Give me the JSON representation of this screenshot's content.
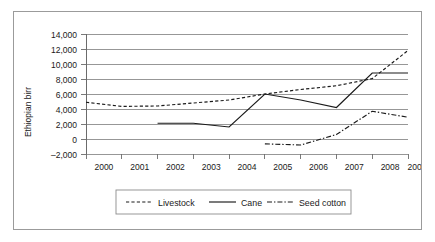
{
  "figure": {
    "name": "ethiopian-birr-commodity-line-chart",
    "border_color": "#9b9b9b",
    "background_color": "#ffffff"
  },
  "chart_data": {
    "type": "line",
    "title": "",
    "xlabel": "",
    "ylabel": "Ethiopian birr",
    "x": [
      2000,
      2001,
      2002,
      2003,
      2004,
      2005,
      2006,
      2007,
      2008,
      2009
    ],
    "categories": [
      "2000",
      "2001",
      "2002",
      "2003",
      "2004",
      "2005",
      "2006",
      "2007",
      "2008",
      "2009"
    ],
    "ylim": [
      -2000,
      14000
    ],
    "ytick_values": [
      -2000,
      0,
      2000,
      4000,
      6000,
      8000,
      10000,
      12000,
      14000
    ],
    "ytick_labels": [
      "–2,000",
      "0",
      "2,000",
      "4,000",
      "6,000",
      "8,000",
      "10,000",
      "12,000",
      "14,000"
    ],
    "grid": true,
    "grid_axis": "y",
    "legend_position": "bottom",
    "series": [
      {
        "name": "Livestock",
        "style": "dashed",
        "color": "#1a1a1a",
        "x": [
          2000,
          2001,
          2002,
          2003,
          2004,
          2005,
          2006,
          2007,
          2008,
          2009
        ],
        "values": [
          4900,
          4350,
          4400,
          4800,
          5200,
          6000,
          6600,
          7100,
          8050,
          11800
        ]
      },
      {
        "name": "Cane",
        "style": "solid",
        "color": "#1a1a1a",
        "x": [
          2002,
          2003,
          2004,
          2005,
          2006,
          2007,
          2008,
          2009
        ],
        "values": [
          2100,
          2100,
          1600,
          6000,
          5200,
          4200,
          8800,
          8800
        ]
      },
      {
        "name": "Seed cotton",
        "style": "dash-dot",
        "color": "#1a1a1a",
        "x": [
          2005,
          2006,
          2007,
          2008,
          2009
        ],
        "values": [
          -650,
          -800,
          600,
          3700,
          2900
        ]
      }
    ]
  },
  "legend": {
    "items": [
      {
        "label": "Livestock",
        "style": "dashed"
      },
      {
        "label": "Cane",
        "style": "solid"
      },
      {
        "label": "Seed cotton",
        "style": "dash-dot"
      }
    ]
  }
}
